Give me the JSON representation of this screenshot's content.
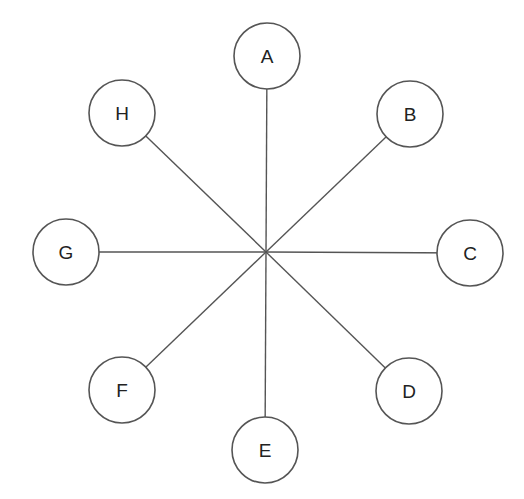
{
  "diagram": {
    "type": "star-graph",
    "hub": {
      "x": 266,
      "y": 252
    },
    "node_radius": 33,
    "colors": {
      "stroke": "#555555",
      "fill": "#ffffff",
      "text": "#222222"
    },
    "nodes": [
      {
        "id": "A",
        "label": "A",
        "x": 267,
        "y": 56
      },
      {
        "id": "B",
        "label": "B",
        "x": 410,
        "y": 114
      },
      {
        "id": "C",
        "label": "C",
        "x": 470,
        "y": 253
      },
      {
        "id": "D",
        "label": "D",
        "x": 409,
        "y": 391
      },
      {
        "id": "E",
        "label": "E",
        "x": 265,
        "y": 450
      },
      {
        "id": "F",
        "label": "F",
        "x": 122,
        "y": 390
      },
      {
        "id": "G",
        "label": "G",
        "x": 66,
        "y": 252
      },
      {
        "id": "H",
        "label": "H",
        "x": 122,
        "y": 113
      }
    ],
    "edges": [
      {
        "from": "hub",
        "to": "A"
      },
      {
        "from": "hub",
        "to": "B"
      },
      {
        "from": "hub",
        "to": "C"
      },
      {
        "from": "hub",
        "to": "D"
      },
      {
        "from": "hub",
        "to": "E"
      },
      {
        "from": "hub",
        "to": "F"
      },
      {
        "from": "hub",
        "to": "G"
      },
      {
        "from": "hub",
        "to": "H"
      }
    ]
  }
}
